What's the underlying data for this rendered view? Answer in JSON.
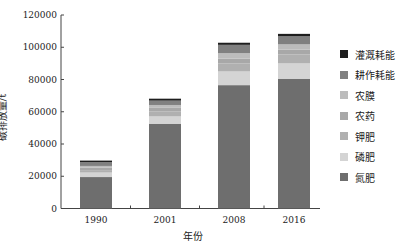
{
  "chart_data": {
    "type": "bar",
    "stacked": true,
    "title": "",
    "xlabel": "年份",
    "ylabel": "碳排放量/t",
    "ylim": [
      0,
      120000
    ],
    "yticks": [
      0,
      20000,
      40000,
      60000,
      80000,
      100000,
      120000
    ],
    "categories": [
      "1990",
      "2001",
      "2008",
      "2016"
    ],
    "series": [
      {
        "name": "氮肥",
        "color": "#6e6e6e",
        "values": [
          19500,
          52600,
          76500,
          80500
        ]
      },
      {
        "name": "磷肥",
        "color": "#d4d4d4",
        "values": [
          2800,
          4500,
          8500,
          9500
        ]
      },
      {
        "name": "钾肥",
        "color": "#b0b0b0",
        "values": [
          1500,
          3000,
          5000,
          5500
        ]
      },
      {
        "name": "农药",
        "color": "#a8a8a8",
        "values": [
          1600,
          2600,
          3000,
          3000
        ]
      },
      {
        "name": "农膜",
        "color": "#bcbcbc",
        "values": [
          1000,
          1500,
          3300,
          3300
        ]
      },
      {
        "name": "耕作耗能",
        "color": "#808080",
        "values": [
          2400,
          2700,
          5200,
          5000
        ]
      },
      {
        "name": "灌溉耗能",
        "color": "#1e1e1e",
        "values": [
          900,
          1200,
          1300,
          1500
        ]
      }
    ],
    "legend_position": "right",
    "grid": false
  },
  "legend": {
    "items": [
      "灌溉耗能",
      "耕作耗能",
      "农膜",
      "农药",
      "钾肥",
      "磷肥",
      "氮肥"
    ]
  }
}
